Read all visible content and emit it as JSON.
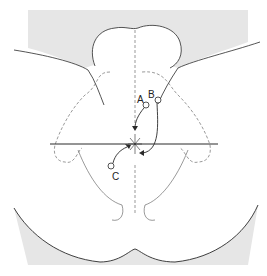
{
  "diagram": {
    "labels": [
      {
        "id": "A",
        "text": "A"
      },
      {
        "id": "B",
        "text": "B"
      },
      {
        "id": "C",
        "text": "C"
      }
    ],
    "colors": {
      "background_shade": "#e6e6e6",
      "line": "#2a2a2a",
      "dashed": "#555555"
    }
  }
}
